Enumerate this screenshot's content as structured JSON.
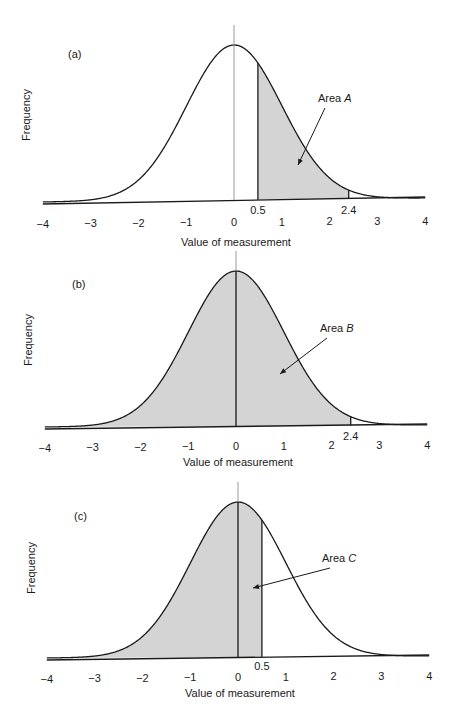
{
  "chart_data": [
    {
      "type": "area",
      "panel_label": "(a)",
      "title": "",
      "xlabel": "Value of measurement",
      "ylabel": "Frequency",
      "xlim": [
        -4,
        4
      ],
      "xticks": [
        -4,
        -3,
        -2,
        -1,
        0,
        1,
        2,
        3,
        4
      ],
      "distribution": "standard normal",
      "shaded_region": [
        0.5,
        2.4
      ],
      "marker_labels": [
        "0.5",
        "2.4"
      ],
      "center_line": 0,
      "annotation": {
        "text": "Area ",
        "var": "A"
      },
      "grid": false
    },
    {
      "type": "area",
      "panel_label": "(b)",
      "title": "",
      "xlabel": "Value of measurement",
      "ylabel": "Frequency",
      "xlim": [
        -4,
        4
      ],
      "xticks": [
        -4,
        -3,
        -2,
        -1,
        0,
        1,
        2,
        3,
        4
      ],
      "distribution": "standard normal",
      "shaded_region": [
        -4,
        2.4
      ],
      "marker_labels": [
        "2.4"
      ],
      "center_line": 0,
      "annotation": {
        "text": "Area ",
        "var": "B"
      },
      "grid": false
    },
    {
      "type": "area",
      "panel_label": "(c)",
      "title": "",
      "xlabel": "Value of measurement",
      "ylabel": "Frequency",
      "xlim": [
        -4,
        4
      ],
      "xticks": [
        -4,
        -3,
        -2,
        -1,
        0,
        1,
        2,
        3,
        4
      ],
      "distribution": "standard normal",
      "shaded_region": [
        -4,
        0.5
      ],
      "marker_labels": [
        "0.5"
      ],
      "center_line": 0,
      "annotation": {
        "text": "Area ",
        "var": "C"
      },
      "grid": false
    }
  ],
  "colors": {
    "shade": "#d4d4d4",
    "line": "#1a1a1a",
    "center_line": "#9a9a9a"
  },
  "tick_labels": [
    "−4",
    "−3",
    "−2",
    "−1",
    "0",
    "1",
    "2",
    "3",
    "4"
  ]
}
